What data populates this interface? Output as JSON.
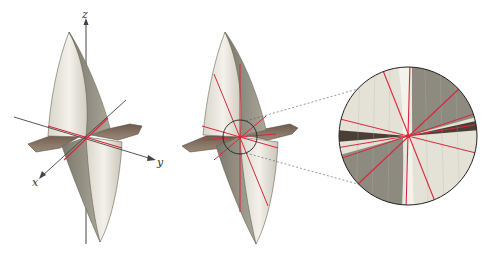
{
  "figure": {
    "panels": [
      {
        "id": "left",
        "description": "3D surface with coordinate axes and two red lines through origin"
      },
      {
        "id": "middle",
        "description": "Same surface with several red lines through origin and a circled neighborhood"
      },
      {
        "id": "right",
        "description": "Magnified view of circled neighborhood showing red lines through center point"
      }
    ],
    "axes": {
      "x_label": "x",
      "y_label": "y",
      "z_label": "z"
    },
    "colors": {
      "surface_light": "#e9e6dc",
      "surface_dark": "#8d8a7e",
      "red_lines": "#d8283a",
      "axis": "#333333",
      "circle": "#222222"
    }
  }
}
